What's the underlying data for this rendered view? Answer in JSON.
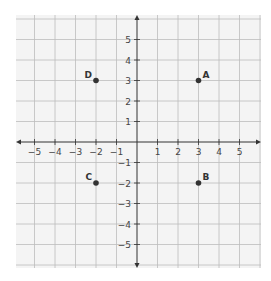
{
  "chart_data": {
    "type": "scatter",
    "title": "",
    "xlabel": "",
    "ylabel": "",
    "xlim": [
      -6,
      6
    ],
    "ylim": [
      -6,
      6
    ],
    "grid": true,
    "x_ticks": [
      -5,
      -4,
      -3,
      -2,
      -1,
      1,
      2,
      3,
      4,
      5
    ],
    "y_ticks": [
      5,
      4,
      3,
      2,
      1,
      -1,
      -2,
      -3,
      -4,
      -5
    ],
    "points": [
      {
        "label": "A",
        "x": 3,
        "y": 3
      },
      {
        "label": "B",
        "x": 3,
        "y": -2
      },
      {
        "label": "C",
        "x": -2,
        "y": -2
      },
      {
        "label": "D",
        "x": -2,
        "y": 3
      }
    ]
  },
  "colors": {
    "grid_bg": "#f4f4f4",
    "grid_line": "#bdbdbd",
    "axis": "#333333",
    "point": "#333333"
  }
}
